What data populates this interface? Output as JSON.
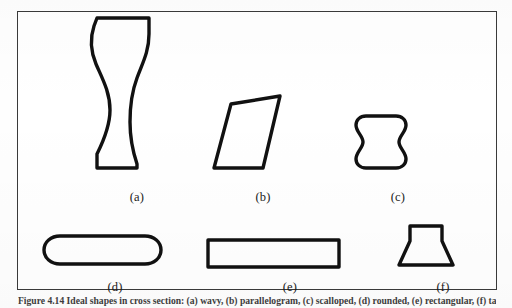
{
  "figure": {
    "caption_prefix": "Figure 4.14",
    "caption_text": "Figure 4.14  Ideal shapes in cross section: (a) wavy, (b) parallelogram, (c) scalloped, (d) rounded, (e) rectangular, (f) tapered.",
    "frame_color": "#3a3a3a",
    "background_color": "#ffffff",
    "outline_color": "#111111"
  },
  "shapes": [
    {
      "id": "shape-a",
      "label": "(a)",
      "name": "wavy-column-shape",
      "stroke_width": 3.4,
      "path": "M 79 6 L 131 6 L 131 22 C 131 40 124 52 119 66 C 113 82 112 96 112 110 C 112 126 115 140 119 152 L 119 156 L 79 156 L 79 142 C 86 128 92 114 92 98 C 92 80 84 66 78 52 C 73 40 72 26 76 14 Z"
    },
    {
      "id": "shape-b",
      "label": "(b)",
      "name": "parallelogram-shape",
      "stroke_width": 3.4,
      "path": "M 213 92 L 262 84 L 245 156 L 196 156 Z"
    },
    {
      "id": "shape-c",
      "label": "(c)",
      "name": "scalloped-square-shape",
      "stroke_width": 3.4,
      "path": "M 348 104 L 378 104 C 384 104 388 108 388 113 C 388 120 381 124 381 130 C 381 136 388 140 388 147 C 388 152 384 156 378 156 L 348 156 C 342 156 338 152 338 147 C 338 140 345 136 345 130 C 345 124 338 120 338 113 C 338 108 342 104 348 104 Z"
    },
    {
      "id": "shape-d",
      "label": "(d)",
      "name": "rounded-pill-shape",
      "stroke_width": 3.4,
      "path": "M 42 224 L 127 224 C 136 224 143 230 143 238 C 143 246 136 252 127 252 L 42 252 C 33 252 26 246 26 238 C 26 230 33 224 42 224 Z"
    },
    {
      "id": "shape-e",
      "label": "(e)",
      "name": "rectangle-shape",
      "stroke_width": 3.4,
      "path": "M 190 228 L 321 228 L 321 255 L 190 255 Z"
    },
    {
      "id": "shape-f",
      "label": "(f)",
      "name": "tapered-anvil-shape",
      "stroke_width": 3.4,
      "path": "M 392 214 L 424 214 L 424 229 L 435 253 L 381 253 L 392 229 Z"
    }
  ]
}
